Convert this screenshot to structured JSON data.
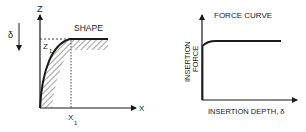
{
  "shape_diagram": {
    "title": "SHAPE",
    "z_axis_label": "Z",
    "x_axis_label": "X",
    "z1_label": "Z",
    "z1_subscript": "1",
    "x1_label": "X",
    "x1_subscript": "1",
    "delta_label": "δ"
  },
  "force_diagram": {
    "title": "FORCE CURVE",
    "y_axis_label_line1": "INSERTION",
    "y_axis_label_line2": "FORCE",
    "x_axis_label": "INSERTION DEPTH, δ"
  },
  "colors": {
    "ink": "#1a1a1a",
    "background": "#ffffff"
  }
}
